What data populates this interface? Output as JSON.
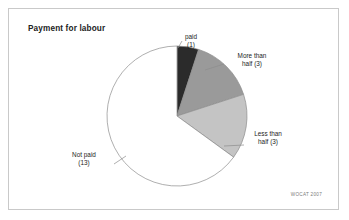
{
  "figure": {
    "title": "Payment for labour",
    "credit": "WOCAT 2007"
  },
  "chart_data": {
    "type": "pie",
    "title": "Payment for labour",
    "xlabel": "",
    "ylabel": "",
    "total": 20,
    "start_angle_deg": 0,
    "direction": "clockwise",
    "legend_position": "none",
    "grid": false,
    "categories": [
      "paid",
      "More than half",
      "Less than half",
      "Not paid"
    ],
    "values": [
      1,
      3,
      3,
      13
    ],
    "slices": [
      {
        "label": "paid",
        "count": 1,
        "label_line1": "paid",
        "label_line2": "(1)",
        "percent": 5,
        "angle_deg": 18,
        "start_deg": 0,
        "end_deg": 18,
        "color": "#2b2b2b"
      },
      {
        "label": "More than half",
        "count": 3,
        "label_line1": "More than",
        "label_line2": "half (3)",
        "percent": 15,
        "angle_deg": 54,
        "start_deg": 18,
        "end_deg": 72,
        "color": "#9a9a9a"
      },
      {
        "label": "Less than half",
        "count": 3,
        "label_line1": "Less than",
        "label_line2": "half (3)",
        "percent": 15,
        "angle_deg": 54,
        "start_deg": 72,
        "end_deg": 126,
        "color": "#c4c4c4"
      },
      {
        "label": "Not paid",
        "count": 13,
        "label_line1": "Not paid",
        "label_line2": "(13)",
        "percent": 65,
        "angle_deg": 234,
        "start_deg": 126,
        "end_deg": 360,
        "color": "#ffffff"
      }
    ],
    "colors": {
      "paid": "#2b2b2b",
      "more_than_half": "#9a9a9a",
      "less_than_half": "#c4c4c4",
      "not_paid": "#ffffff",
      "outline": "#8d8d8d",
      "frame": "#c9c9c9"
    }
  }
}
